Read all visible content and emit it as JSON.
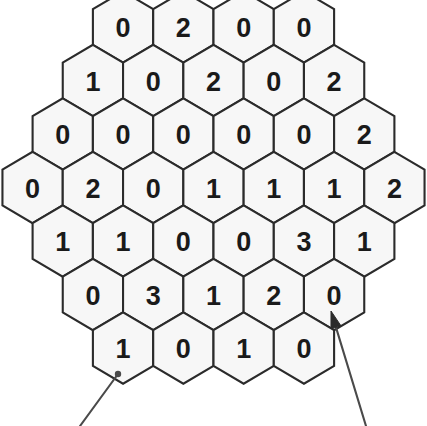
{
  "figure": {
    "name": "hexagonal-number-grid",
    "background_color": "#ffffff",
    "cell_fill": "#f7f7f7",
    "cell_stroke": "#2b2b2b",
    "label_color": "#1a1a1a",
    "pointer_color": "#4a4a4a"
  },
  "grid": {
    "orientation": "pointy-top",
    "hex_width": 60.3,
    "hex_vertical_pitch": 53.5,
    "shape": "hexagonal-rosette",
    "row_count": 7,
    "cell_count": 37,
    "rows": [
      {
        "index": 0,
        "cell_count": 4,
        "values": [
          "0",
          "2",
          "0",
          "0"
        ]
      },
      {
        "index": 1,
        "cell_count": 5,
        "values": [
          "1",
          "0",
          "2",
          "0",
          "2"
        ]
      },
      {
        "index": 2,
        "cell_count": 6,
        "values": [
          "0",
          "0",
          "0",
          "0",
          "0",
          "2"
        ]
      },
      {
        "index": 3,
        "cell_count": 7,
        "values": [
          "0",
          "2",
          "0",
          "1",
          "1",
          "1",
          "2"
        ]
      },
      {
        "index": 4,
        "cell_count": 6,
        "values": [
          "1",
          "1",
          "0",
          "0",
          "3",
          "1"
        ]
      },
      {
        "index": 5,
        "cell_count": 5,
        "values": [
          "0",
          "3",
          "1",
          "2",
          "0"
        ]
      },
      {
        "index": 6,
        "cell_count": 4,
        "values": [
          "1",
          "0",
          "1",
          "0"
        ]
      }
    ]
  },
  "annotations": {
    "pointers": [
      {
        "name": "leader-line-bottom-left",
        "style": "dot",
        "target_row": 6,
        "target_cell": 0,
        "target_value": "1",
        "tip_x": 118,
        "tip_y": 374,
        "tail_x": 80,
        "tail_y": 426
      },
      {
        "name": "arrow-bottom-right",
        "style": "arrowhead",
        "target_row": 5,
        "target_cell": 4,
        "target_value": "0",
        "tip_x": 331,
        "tip_y": 311,
        "tail_x": 366,
        "tail_y": 426
      }
    ]
  }
}
